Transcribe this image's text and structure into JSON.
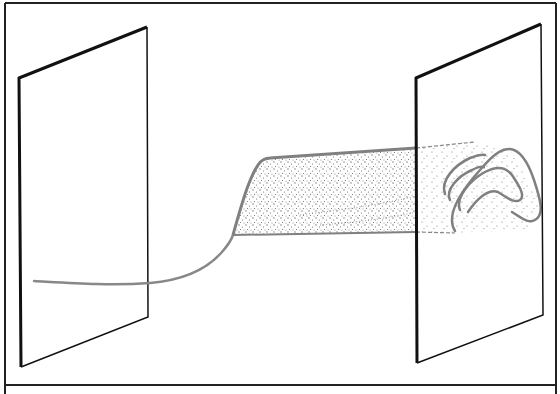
{
  "figure": {
    "type": "schematic-illustration",
    "colors": {
      "frame": "#222222",
      "plane_edge": "#111111",
      "band_outline": "#808080",
      "stipple": "#7a7a7a",
      "background": "#ffffff"
    },
    "elements": [
      {
        "name": "left-plane",
        "label": ""
      },
      {
        "name": "right-plane",
        "label": ""
      },
      {
        "name": "stippled-band",
        "label": ""
      },
      {
        "name": "nested-arcs",
        "count": 3,
        "label": ""
      }
    ],
    "caption": ""
  }
}
